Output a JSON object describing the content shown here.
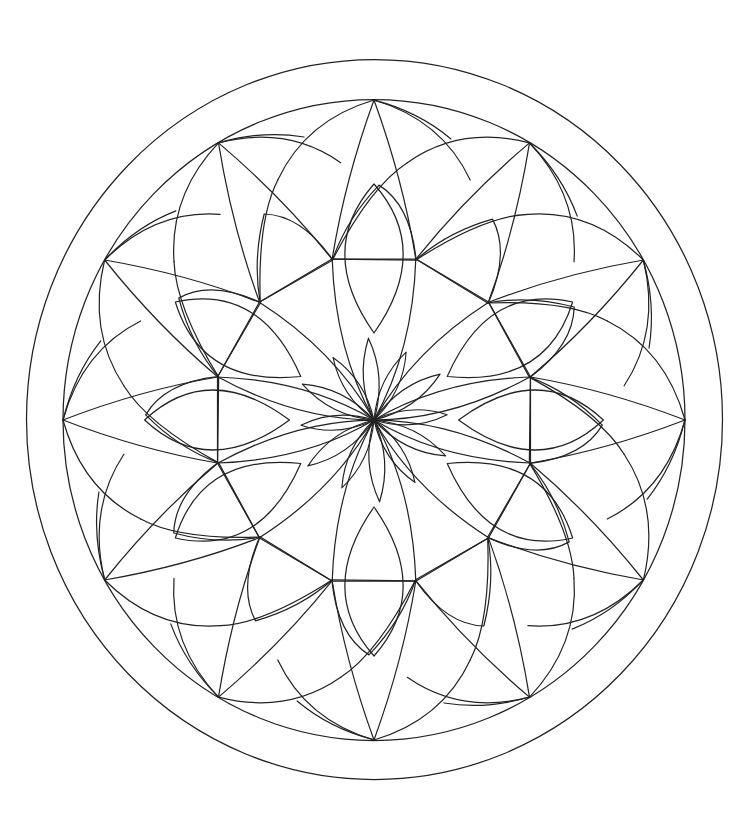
{
  "image": {
    "title": "Mandala coloring page",
    "description": "Black line-art mandala with 12-fold symmetry inside a double circular border on white background"
  },
  "colors": {
    "background": "#ffffff",
    "stroke": "#222222"
  },
  "geometry": {
    "center": [
      374,
      420
    ],
    "outer_ring": {
      "rx": 348,
      "ry": 360
    },
    "inner_ring": {
      "rx": 311,
      "ry": 320
    },
    "outer_vertex_count": 12,
    "inner_point_count": 12,
    "center_flower_petals": 12
  }
}
